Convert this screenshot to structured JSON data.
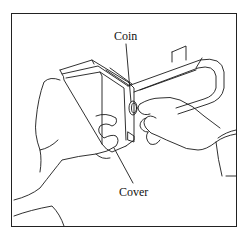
{
  "figure": {
    "labels": {
      "coin": "Coin",
      "cover": "Cover"
    }
  }
}
